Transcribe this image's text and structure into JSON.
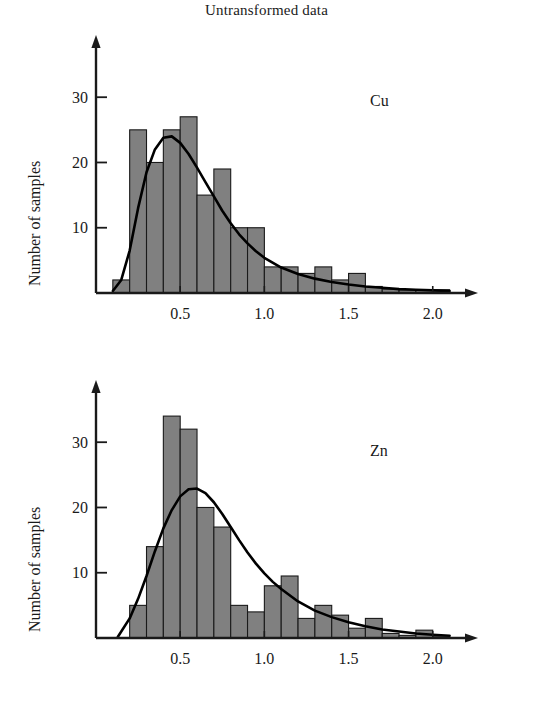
{
  "figure": {
    "title": "Untransformed data",
    "background": "#ffffff",
    "bar_fill": "#808080",
    "bar_stroke": "#1a1a1a",
    "curve_color": "#000000",
    "axis_color": "#1a1a1a"
  },
  "panels": [
    {
      "id": "cu",
      "series_label": "Cu",
      "ylabel": "Number of samples",
      "xlabel": ""
    },
    {
      "id": "zn",
      "series_label": "Zn",
      "ylabel": "Number of samples",
      "xlabel": ""
    }
  ],
  "chart_data": [
    {
      "type": "bar",
      "id": "cu",
      "title": "Untransformed data",
      "series_label": "Cu",
      "xlabel": "",
      "ylabel": "Number of samples",
      "xlim": [
        0.0,
        2.15
      ],
      "ylim": [
        0,
        38
      ],
      "xticks": [
        0.5,
        1.0,
        1.5,
        2.0
      ],
      "xtick_labels": [
        "0.5",
        "1.0",
        "1.5",
        "2.0"
      ],
      "yticks": [
        10,
        20,
        30
      ],
      "ytick_labels": [
        "10",
        "20",
        "30"
      ],
      "grid": false,
      "legend": "none",
      "bin_width": 0.1,
      "bin_starts": [
        0.1,
        0.2,
        0.3,
        0.4,
        0.5,
        0.6,
        0.7,
        0.8,
        0.9,
        1.0,
        1.1,
        1.2,
        1.3,
        1.4,
        1.5,
        1.6,
        1.7,
        1.8,
        1.9,
        2.0
      ],
      "values": [
        2,
        25,
        20,
        25,
        27,
        15,
        19,
        10,
        10,
        4,
        4,
        3,
        4,
        2,
        3,
        1,
        0.6,
        0.5,
        0.5,
        0.5
      ],
      "overlay_curve": {
        "name": "fitted lognormal curve",
        "x": [
          0.1,
          0.15,
          0.2,
          0.25,
          0.3,
          0.35,
          0.4,
          0.45,
          0.5,
          0.55,
          0.6,
          0.65,
          0.7,
          0.75,
          0.8,
          0.85,
          0.9,
          0.95,
          1.0,
          1.1,
          1.2,
          1.3,
          1.4,
          1.5,
          1.6,
          1.7,
          1.8,
          1.9,
          2.0,
          2.1
        ],
        "y": [
          0.3,
          2.0,
          6.5,
          13.0,
          18.5,
          22.0,
          23.8,
          24.0,
          23.0,
          21.3,
          19.2,
          17.0,
          14.8,
          12.6,
          10.7,
          9.0,
          7.6,
          6.4,
          5.4,
          3.9,
          2.9,
          2.2,
          1.7,
          1.3,
          1.0,
          0.8,
          0.6,
          0.5,
          0.4,
          0.3
        ]
      }
    },
    {
      "type": "bar",
      "id": "zn",
      "title": "",
      "series_label": "Zn",
      "xlabel": "",
      "ylabel": "Number of samples",
      "xlim": [
        0.0,
        2.15
      ],
      "ylim": [
        0,
        38
      ],
      "xticks": [
        0.5,
        1.0,
        1.5,
        2.0
      ],
      "xtick_labels": [
        "0.5",
        "1.0",
        "1.5",
        "2.0"
      ],
      "yticks": [
        10,
        20,
        30
      ],
      "ytick_labels": [
        "10",
        "20",
        "30"
      ],
      "grid": false,
      "legend": "none",
      "bin_width": 0.1,
      "bin_starts": [
        0.2,
        0.3,
        0.4,
        0.5,
        0.6,
        0.7,
        0.8,
        0.9,
        1.0,
        1.1,
        1.2,
        1.3,
        1.4,
        1.5,
        1.6,
        1.7,
        1.8,
        1.9,
        2.0
      ],
      "values": [
        5,
        14,
        34,
        32,
        20,
        17,
        5,
        4,
        8,
        9.5,
        3,
        5,
        3.5,
        1.5,
        3,
        0.7,
        0.4,
        1.2,
        0.3
      ],
      "overlay_curve": {
        "name": "fitted lognormal curve",
        "x": [
          0.13,
          0.2,
          0.25,
          0.3,
          0.35,
          0.4,
          0.45,
          0.5,
          0.55,
          0.6,
          0.65,
          0.7,
          0.75,
          0.8,
          0.85,
          0.9,
          0.95,
          1.0,
          1.05,
          1.1,
          1.2,
          1.3,
          1.4,
          1.5,
          1.6,
          1.7,
          1.8,
          1.9,
          2.0,
          2.1
        ],
        "y": [
          0.2,
          3.0,
          6.0,
          9.5,
          13.3,
          16.8,
          19.6,
          21.7,
          22.8,
          22.9,
          22.2,
          20.8,
          19.0,
          17.0,
          15.0,
          13.1,
          11.4,
          9.9,
          8.6,
          7.5,
          5.6,
          4.2,
          3.2,
          2.4,
          1.8,
          1.3,
          1.0,
          0.7,
          0.5,
          0.35
        ]
      }
    }
  ]
}
